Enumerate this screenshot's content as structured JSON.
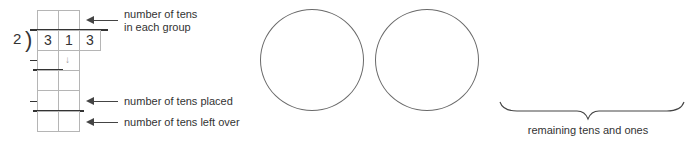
{
  "division": {
    "divisor": "2",
    "bracket": ")",
    "dividend_digits": [
      "3",
      "1",
      "3"
    ],
    "minus_sign": "–",
    "carry_down_arrow": "↓"
  },
  "labels": {
    "tens_each_group_line1": "number of tens",
    "tens_each_group_line2": "in each group",
    "tens_placed": "number of tens placed",
    "tens_left_over": "number of tens left over"
  },
  "groups": {
    "count": 2
  },
  "brace": {
    "caption": "remaining tens and ones"
  },
  "colors": {
    "text": "#333333",
    "grid": "#b5b5b5",
    "circle": "#6a6a6a",
    "arrow": "#444444",
    "carry_arrow": "#9a9a9a"
  }
}
